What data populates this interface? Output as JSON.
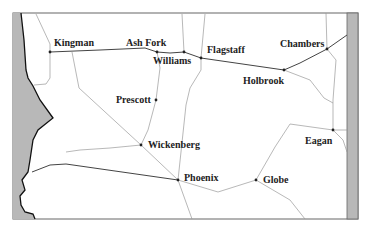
{
  "map": {
    "colors": {
      "background": "#ffffff",
      "frame": "#666666",
      "land_gray": "#b8b8b8",
      "coast_line": "#111111",
      "major_road": "#444444",
      "minor_road": "#999999",
      "city_dot": "#222222",
      "label": "#222222"
    },
    "cities": [
      {
        "name": "Kingman",
        "x": 50,
        "y": 52,
        "label_x": 54,
        "label_y": 38
      },
      {
        "name": "Ash Fork",
        "x": 157,
        "y": 52,
        "label_x": 126,
        "label_y": 38
      },
      {
        "name": "Williams",
        "x": 184,
        "y": 52,
        "label_x": 153,
        "label_y": 56
      },
      {
        "name": "Flagstaff",
        "x": 201,
        "y": 58,
        "label_x": 207,
        "label_y": 45
      },
      {
        "name": "Chambers",
        "x": 327,
        "y": 49,
        "label_x": 280,
        "label_y": 39
      },
      {
        "name": "Holbrook",
        "x": 284,
        "y": 70,
        "label_x": 243,
        "label_y": 76
      },
      {
        "name": "Prescott",
        "x": 156,
        "y": 100,
        "label_x": 116,
        "label_y": 95
      },
      {
        "name": "Wickenberg",
        "x": 141,
        "y": 145,
        "label_x": 148,
        "label_y": 140
      },
      {
        "name": "Eagan",
        "x": 333,
        "y": 130,
        "label_x": 305,
        "label_y": 136
      },
      {
        "name": "Phoenix",
        "x": 178,
        "y": 180,
        "label_x": 184,
        "label_y": 173
      },
      {
        "name": "Globe",
        "x": 256,
        "y": 180,
        "label_x": 263,
        "label_y": 175
      }
    ]
  }
}
